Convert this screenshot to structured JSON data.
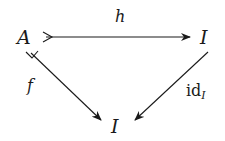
{
  "diagram": {
    "type": "commutative-triangle",
    "nodes": [
      {
        "id": "A",
        "label": "A",
        "x": 26,
        "y": 43
      },
      {
        "id": "I_top",
        "label": "I",
        "x": 205,
        "y": 43
      },
      {
        "id": "I_bottom",
        "label": "I",
        "x": 118,
        "y": 132
      }
    ],
    "edges": [
      {
        "id": "h",
        "from": "A",
        "to": "I_top",
        "label": "h",
        "tail": "monomorphism"
      },
      {
        "id": "f",
        "from": "A",
        "to": "I_bottom",
        "label": "f",
        "tail": "monomorphism"
      },
      {
        "id": "id",
        "from": "I_top",
        "to": "I_bottom",
        "label": "id",
        "label_subscript": "I",
        "tail": "none"
      }
    ]
  },
  "colors": {
    "ink": "#1a1a1a",
    "background": "#ffffff"
  }
}
